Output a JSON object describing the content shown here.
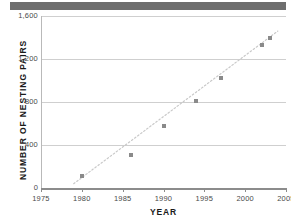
{
  "chart_data": {
    "type": "scatter",
    "title": "",
    "xlabel": "YEAR",
    "ylabel": "NUMBER OF NESTING PAIRS",
    "xlim": [
      1975,
      2005
    ],
    "ylim": [
      0,
      1600
    ],
    "grid": true,
    "legend": "none",
    "x_ticks": [
      "1975",
      "1980",
      "1985",
      "1990",
      "1995",
      "2000",
      "2005"
    ],
    "x_tick_values": [
      1975,
      1980,
      1985,
      1990,
      1995,
      2000,
      2005
    ],
    "y_ticks": [
      "0",
      "400",
      "800",
      "1,200",
      "1,600"
    ],
    "y_tick_values": [
      0,
      400,
      800,
      1200,
      1600
    ],
    "series": [
      {
        "name": "Nesting pairs",
        "points": [
          {
            "x": 1980,
            "y": 110
          },
          {
            "x": 1986,
            "y": 310
          },
          {
            "x": 1990,
            "y": 580
          },
          {
            "x": 1994,
            "y": 810
          },
          {
            "x": 1997,
            "y": 1020
          },
          {
            "x": 2002,
            "y": 1330
          },
          {
            "x": 2003,
            "y": 1400
          }
        ]
      }
    ],
    "trend_line": {
      "visible": true,
      "style": "dotted",
      "from": {
        "x": 1979,
        "y": 40
      },
      "to": {
        "x": 2004,
        "y": 1460
      }
    }
  },
  "colors": {
    "banner": "#6e6e6e",
    "gridline": "#cfcfcf",
    "axis": "#8c8c8c",
    "marker": "#8a8a8a",
    "trend": "#c9c9c9",
    "text": "#4a4a4a",
    "title_text": "#1a1a1a",
    "background": "#ffffff"
  },
  "banner": {
    "label": ""
  }
}
